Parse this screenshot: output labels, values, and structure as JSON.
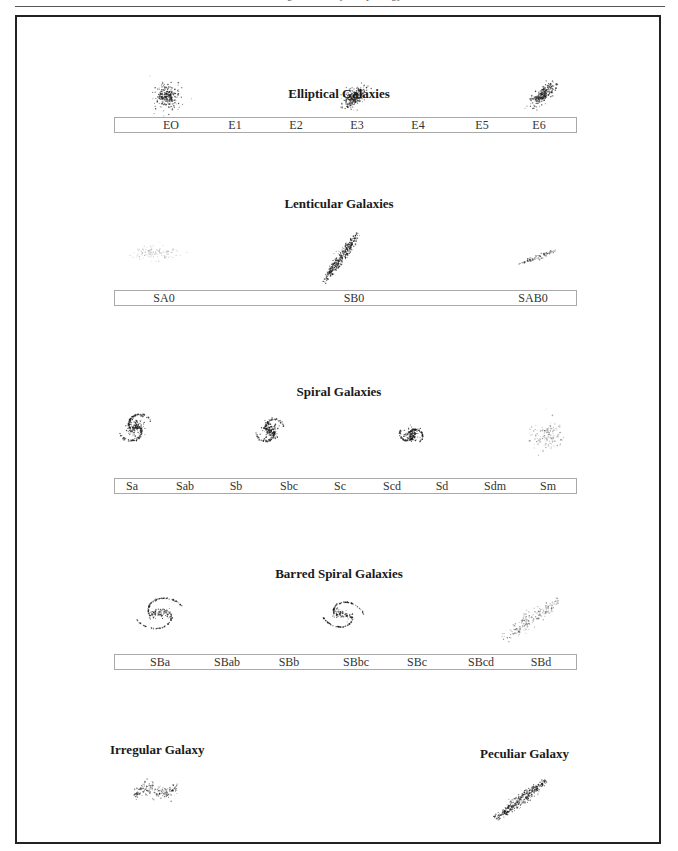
{
  "page": {
    "running_header": "Figure: Galaxy morphology"
  },
  "sections": {
    "elliptical": {
      "title": "Elliptical Galaxies",
      "labels": [
        "EO",
        "E1",
        "E2",
        "E3",
        "E4",
        "E5",
        "E6"
      ],
      "images": [
        "E0 galaxy",
        "E3 galaxy",
        "E6 galaxy"
      ]
    },
    "lenticular": {
      "title": "Lenticular Galaxies",
      "labels": [
        "SA0",
        "SB0",
        "SAB0"
      ],
      "images": [
        "SA0 galaxy",
        "SB0 galaxy",
        "SAB0 galaxy"
      ]
    },
    "spiral": {
      "title": "Spiral Galaxies",
      "labels": [
        "Sa",
        "Sab",
        "Sb",
        "Sbc",
        "Sc",
        "Scd",
        "Sd",
        "Sdm",
        "Sm"
      ],
      "images": [
        "Sa galaxy",
        "Sbc galaxy",
        "Scd galaxy",
        "Sm galaxy"
      ]
    },
    "barred": {
      "title": "Barred Spiral Galaxies",
      "labels": [
        "SBa",
        "SBab",
        "SBb",
        "SBbc",
        "SBc",
        "SBcd",
        "SBd"
      ],
      "images": [
        "SBa galaxy",
        "SBbc galaxy",
        "SBd galaxy"
      ]
    },
    "irregular": {
      "title": "Irregular Galaxy",
      "images": [
        "Irregular galaxy"
      ]
    },
    "peculiar": {
      "title": "Peculiar Galaxy",
      "images": [
        "Peculiar galaxy"
      ]
    }
  },
  "colors": {
    "ink": "#1a1a1a",
    "frame": "#222222",
    "label_border": "#a9a9a9"
  }
}
